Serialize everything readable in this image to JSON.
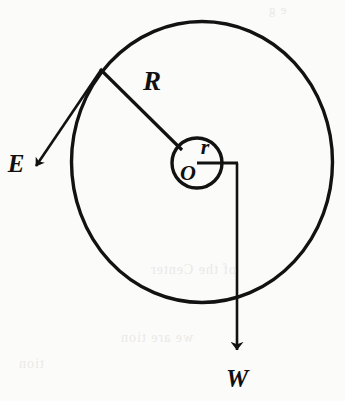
{
  "figure": {
    "background_color": "#fbfbfa",
    "ink_color": "#121212",
    "labels": {
      "outer_radius": "R",
      "inner_radius": "r",
      "center": "O",
      "force_e": "E",
      "force_w": "W"
    },
    "geometry": {
      "outer_circle": {
        "cx": 202,
        "cy": 162,
        "r": 131
      },
      "inner_circle": {
        "cx": 197,
        "cy": 163,
        "r": 25
      },
      "radius_line_R": {
        "x1": 101,
        "y1": 70,
        "x2": 181,
        "y2": 148
      },
      "radius_line_r": {
        "x1": 197,
        "y1": 163,
        "x2": 237,
        "y2": 163
      },
      "arrow_E": {
        "x1": 101,
        "y1": 70,
        "x2": 33,
        "y2": 170
      },
      "arrow_W": {
        "x1": 237,
        "y1": 163,
        "x2": 237,
        "y2": 356
      }
    },
    "label_positions": {
      "outer_radius": {
        "x": 152,
        "y": 90
      },
      "inner_radius": {
        "x": 205,
        "y": 152
      },
      "center": {
        "x": 187,
        "y": 178
      },
      "force_e": {
        "x": 16,
        "y": 170
      },
      "force_w": {
        "x": 237,
        "y": 385
      }
    }
  },
  "bleed_through": {
    "note": "faint mirrored show-through text from reverse side of page",
    "lines": [
      {
        "text": "e g",
        "x": 268,
        "y": 2,
        "size": 13
      },
      {
        "text": "of the  Center",
        "x": 150,
        "y": 262,
        "size": 14
      },
      {
        "text": "we are  tion",
        "x": 120,
        "y": 330,
        "size": 14
      },
      {
        "text": "tion",
        "x": 18,
        "y": 356,
        "size": 14
      }
    ]
  }
}
